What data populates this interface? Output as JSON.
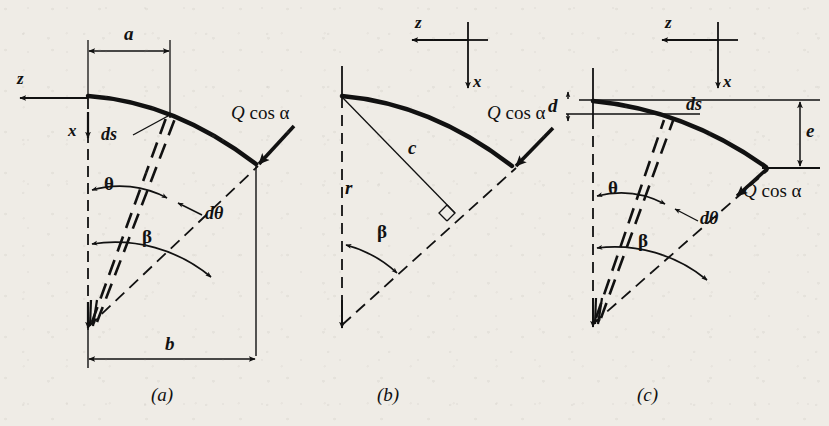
{
  "figure": {
    "background_color": "#efece6",
    "ink_color": "#111111",
    "panels": [
      {
        "id": "a",
        "caption": "(a)",
        "labels": {
          "axis_z": "z",
          "axis_x": "x",
          "dim_a": "a",
          "dim_b": "b",
          "arc_element": "ds",
          "angle_theta": "θ",
          "angle_dtheta": "dθ",
          "angle_beta": "β",
          "load": "Q cos α",
          "load_q": "Q",
          "load_cos": "cos",
          "load_alpha": "α"
        }
      },
      {
        "id": "b",
        "caption": "(b)",
        "labels": {
          "axis_z": "z",
          "axis_x": "x",
          "radius_r": "r",
          "chord_c": "c",
          "angle_beta": "β",
          "load": "Q cos α",
          "load_q": "Q",
          "load_cos": "cos",
          "load_alpha": "α"
        }
      },
      {
        "id": "c",
        "caption": "(c)",
        "labels": {
          "axis_z": "z",
          "axis_x": "x",
          "dim_d": "d",
          "dim_e": "e",
          "arc_element": "ds",
          "angle_theta": "θ",
          "angle_dtheta": "dθ",
          "angle_beta": "β",
          "load": "Q cos α",
          "load_q": "Q",
          "load_cos": "cos",
          "load_alpha": "α"
        }
      }
    ]
  }
}
